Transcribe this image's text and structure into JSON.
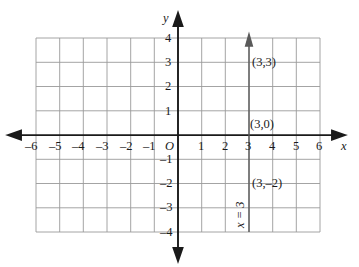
{
  "figure": {
    "background_color": "#ffffff",
    "grid_color": "#9a9a9a",
    "axis_color": "#1a1a1a",
    "line_color": "#555555"
  },
  "axes": {
    "x_axis": {
      "label": "x",
      "min": -6,
      "max": 6,
      "tick_step": 1,
      "tick_labels": [
        "–6",
        "–5",
        "–4",
        "–3",
        "–2",
        "–1",
        "1",
        "2",
        "3",
        "4",
        "5",
        "6"
      ],
      "tick_values": [
        -6,
        -5,
        -4,
        -3,
        -2,
        -1,
        1,
        2,
        3,
        4,
        5,
        6
      ],
      "arrows": [
        "left",
        "right"
      ]
    },
    "y_axis": {
      "label": "y",
      "min": -4,
      "max": 4,
      "tick_step": 1,
      "tick_labels": [
        "4",
        "3",
        "2",
        "1",
        "–1",
        "–2",
        "–3",
        "–4"
      ],
      "tick_values": [
        4,
        3,
        2,
        1,
        -1,
        -2,
        -3,
        -4
      ],
      "arrows": [
        "up",
        "down"
      ]
    },
    "origin_label": "O",
    "grid": "on"
  },
  "plotted_line": {
    "equation_label": "x = 3",
    "type": "vertical-line",
    "x_value": 3,
    "extends_from_y": -4,
    "extends_to_y": 4,
    "arrow_top": true
  },
  "point_labels": [
    {
      "text": "(3,3)",
      "x": 3,
      "y": 3
    },
    {
      "text": "(3,0)",
      "x": 3,
      "y": 0
    },
    {
      "text": "(3,–2)",
      "x": 3,
      "y": -2
    }
  ]
}
